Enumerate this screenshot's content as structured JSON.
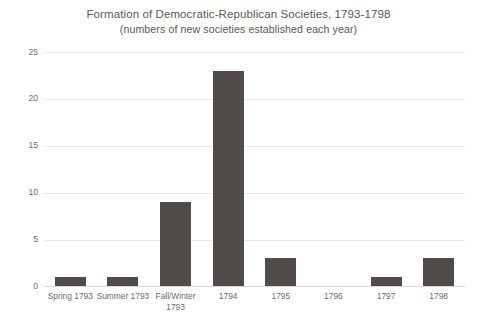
{
  "chart_data": {
    "type": "bar",
    "title": "Formation of Democratic-Republican Societies, 1793-1798",
    "subtitle": "(numbers of new societies established each year)",
    "xlabel": "",
    "ylabel": "",
    "ylim": [
      0,
      25
    ],
    "yticks": [
      0,
      5,
      10,
      15,
      20,
      25
    ],
    "ytick_labels": [
      "0",
      "5",
      "10",
      "15",
      "20",
      "25"
    ],
    "grid": true,
    "legend": false,
    "bar_color": "#514c49",
    "grid_color": "#e9e9e9",
    "text_color": "#6d6d6d",
    "categories": [
      "Spring 1793",
      "Summer 1793",
      "Fall/Winter 1793",
      "1794",
      "1795",
      "1796",
      "1797",
      "1798"
    ],
    "category_lines": [
      [
        "Spring 1793"
      ],
      [
        "Summer 1793"
      ],
      [
        "Fall/Winter",
        "1793"
      ],
      [
        "1794"
      ],
      [
        "1795"
      ],
      [
        "1796"
      ],
      [
        "1797"
      ],
      [
        "1798"
      ]
    ],
    "values": [
      1,
      1,
      9,
      23,
      3,
      0,
      1,
      3
    ]
  }
}
